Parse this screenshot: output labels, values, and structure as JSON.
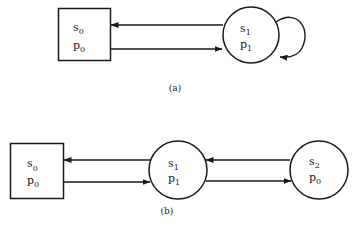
{
  "diagram_a": {
    "caption": "(a)",
    "nodes": [
      {
        "id": "a-n0",
        "shape": "square",
        "state": "s",
        "state_sub": "0",
        "prob": "p",
        "prob_sub": "0"
      },
      {
        "id": "a-n1",
        "shape": "circle",
        "state": "s",
        "state_sub": "1",
        "prob": "p",
        "prob_sub": "1"
      }
    ],
    "edges": [
      {
        "from": "a-n1",
        "to": "a-n0"
      },
      {
        "from": "a-n0",
        "to": "a-n1"
      },
      {
        "from": "a-n1",
        "to": "a-n1",
        "type": "self-loop"
      }
    ]
  },
  "diagram_b": {
    "caption": "(b)",
    "nodes": [
      {
        "id": "b-n0",
        "shape": "square",
        "state": "s",
        "state_sub": "0",
        "prob": "p",
        "prob_sub": "0"
      },
      {
        "id": "b-n1",
        "shape": "circle",
        "state": "s",
        "state_sub": "1",
        "prob": "p",
        "prob_sub": "1"
      },
      {
        "id": "b-n2",
        "shape": "circle",
        "state": "s",
        "state_sub": "2",
        "prob": "p",
        "prob_sub": "0"
      }
    ],
    "edges": [
      {
        "from": "b-n1",
        "to": "b-n0"
      },
      {
        "from": "b-n0",
        "to": "b-n1"
      },
      {
        "from": "b-n2",
        "to": "b-n1"
      },
      {
        "from": "b-n1",
        "to": "b-n2"
      }
    ]
  },
  "colors": {
    "ink": "#1a1a1a",
    "background": "#ffffff"
  }
}
